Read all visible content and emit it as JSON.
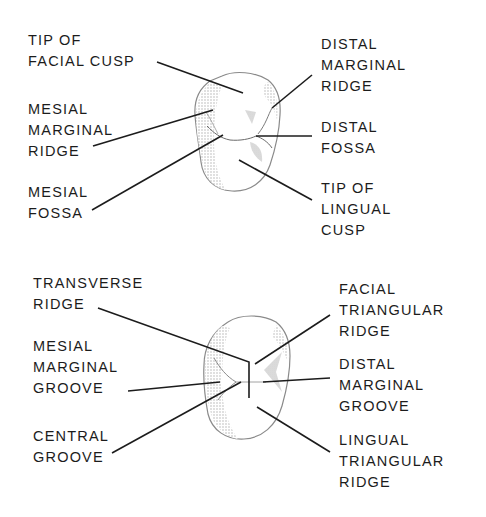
{
  "figure": {
    "top_view": {
      "description": "Occlusal view of premolar with anatomical landmarks (top)",
      "labels": [
        {
          "id": "tip-of-facial-cusp",
          "lines": [
            "TIP OF",
            "FACIAL CUSP"
          ],
          "side": "left"
        },
        {
          "id": "mesial-marginal-ridge",
          "lines": [
            "MESIAL",
            "MARGINAL",
            "RIDGE"
          ],
          "side": "left"
        },
        {
          "id": "mesial-fossa",
          "lines": [
            "MESIAL",
            "FOSSA"
          ],
          "side": "left"
        },
        {
          "id": "distal-marginal-ridge",
          "lines": [
            "DISTAL",
            "MARGINAL",
            "RIDGE"
          ],
          "side": "right"
        },
        {
          "id": "distal-fossa",
          "lines": [
            "DISTAL",
            "FOSSA"
          ],
          "side": "right"
        },
        {
          "id": "tip-of-lingual-cusp",
          "lines": [
            "TIP OF",
            "LINGUAL",
            "CUSP"
          ],
          "side": "right"
        }
      ]
    },
    "bottom_view": {
      "description": "Occlusal view of premolar with ridges and grooves (bottom)",
      "labels": [
        {
          "id": "transverse-ridge",
          "lines": [
            "TRANSVERSE",
            "RIDGE"
          ],
          "side": "left"
        },
        {
          "id": "mesial-marginal-groove",
          "lines": [
            "MESIAL",
            "MARGINAL",
            "GROOVE"
          ],
          "side": "left"
        },
        {
          "id": "central-groove",
          "lines": [
            "CENTRAL",
            "GROOVE"
          ],
          "side": "left"
        },
        {
          "id": "facial-triangular-ridge",
          "lines": [
            "FACIAL",
            "TRIANGULAR",
            "RIDGE"
          ],
          "side": "right"
        },
        {
          "id": "distal-marginal-groove",
          "lines": [
            "DISTAL",
            "MARGINAL",
            "GROOVE"
          ],
          "side": "right"
        },
        {
          "id": "lingual-triangular-ridge",
          "lines": [
            "LINGUAL",
            "TRIANGULAR",
            "RIDGE"
          ],
          "side": "right"
        }
      ]
    },
    "colors": {
      "ink": "#1c1c1c",
      "outline": "#8a8a8a",
      "shading": "#b5b5b5"
    }
  }
}
